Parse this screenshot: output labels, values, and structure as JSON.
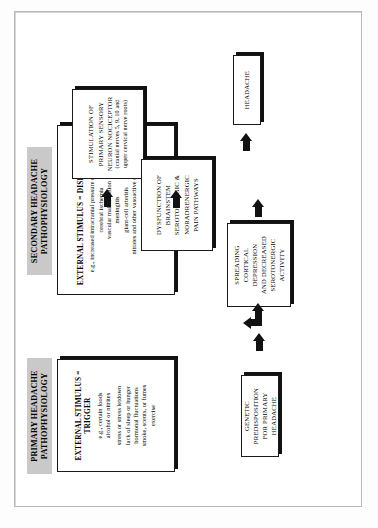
{
  "figure": {
    "type": "flowchart",
    "orientation": "rotated-90-ccw",
    "colors": {
      "banner_background": "#c9c9c9",
      "box_border": "#1b1b1b",
      "box_fill": "#ffffff",
      "arrow": "#121212",
      "frame": "#b9b9b9"
    }
  },
  "banners": {
    "primary": {
      "line1": "PRIMARY HEADACHE",
      "line2": "PATHOPHYSIOLOGY"
    },
    "secondary": {
      "line1": "SECONDARY HEADACHE",
      "line2": "PATHOPHYSIOLOGY"
    }
  },
  "boxes": {
    "primary_stimulus": {
      "title": "EXTERNAL STIMULUS = TRIGGER",
      "subtitle": "e.g., certain foods",
      "items": [
        "alcohol or nitrites",
        "stress or stress letdown",
        "lack of sleep or hunger",
        "hormonal fluctuations",
        "smoke, scents, or fumes",
        "exercise"
      ]
    },
    "secondary_stimulus": {
      "title": "EXTERNAL STIMULUS = DISEASE STATE",
      "subtitle": "e.g., increased intracranial pressure of any cause",
      "items": [
        "cerebral ischemia",
        "vascular malformation",
        "meningitis",
        "giant-cell arteritis",
        "nitrates and other vasoactive drugs",
        "postcarotid endarterectomy",
        "low cerebrospinal fluid pressure"
      ]
    },
    "genetic": {
      "lines": [
        "GENETIC PREDISPOSITION",
        "FOR PRIMARY HEADACHE"
      ]
    },
    "spreading": {
      "lines": [
        "SPREADING",
        "CORTICAL DEPRESSION",
        "AND DECREASED",
        "SEROTONERGIC",
        "ACTIVITY"
      ]
    },
    "stimulation": {
      "lines": [
        "STIMULATION OF",
        "PRIMARY SENSORY",
        "NEURON NOCICEPTOR"
      ],
      "paren": [
        "(cranial nerves 5, 9, 10 and",
        "upper cervical nerve roots)"
      ]
    },
    "dysfunction": {
      "lines": [
        "DYSFUNCTION OF BRAINSTEM",
        "SEROTONERGIC &",
        "NORADRENERGIC",
        "PAIN PATHWAYS"
      ]
    },
    "headache": {
      "label": "HEADACHE"
    }
  },
  "arrows": [
    {
      "name": "primary-stimulus-to-genetic",
      "direction": "right"
    },
    {
      "name": "genetic-to-spreading",
      "direction": "up"
    },
    {
      "name": "secondary-stimulus-to-spreading",
      "direction": "right"
    },
    {
      "name": "secondary-stimulus-to-stimulation",
      "direction": "right"
    },
    {
      "name": "spreading-to-dysfunction",
      "direction": "right"
    },
    {
      "name": "stimulation-to-dysfunction",
      "direction": "right"
    },
    {
      "name": "dysfunction-to-headache",
      "direction": "right"
    }
  ]
}
